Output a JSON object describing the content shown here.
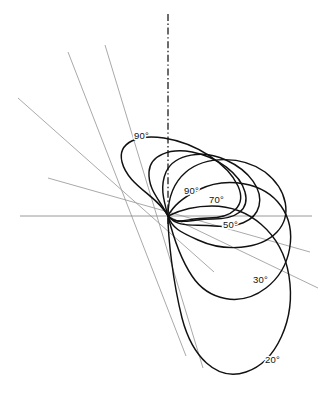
{
  "figure": {
    "kind": "polar-loop-diagram",
    "background_color": "#ffffff",
    "curve_color": "#111111",
    "radial_color": "#9a9a9a",
    "axis_color": "#8f8f8f",
    "centerline_color": "#141414",
    "origin": {
      "x": 168,
      "y": 216
    }
  },
  "labels": {
    "outer_90": "90°",
    "inner_90": "90°",
    "deg_70": "70°",
    "deg_50": "50°",
    "deg_30": "30°",
    "deg_20": "20°"
  },
  "label_positions": {
    "outer_90": {
      "x": 134,
      "y": 139
    },
    "inner_90": {
      "x": 184,
      "y": 194
    },
    "deg_70": {
      "x": 209,
      "y": 203
    },
    "deg_50": {
      "x": 223,
      "y": 228
    },
    "deg_30": {
      "x": 253,
      "y": 283
    },
    "deg_20": {
      "x": 265,
      "y": 363
    }
  },
  "chart_data": {
    "type": "line",
    "title": "",
    "xlabel": "",
    "ylabel": "",
    "coordinate_system": "polar",
    "grid": false,
    "legend": null,
    "origin_px": {
      "x": 168,
      "y": 216
    },
    "annotations": [
      "90°",
      "90°",
      "70°",
      "50°",
      "30°",
      "20°"
    ],
    "axes": [
      {
        "name": "horizontal-axis",
        "x1": 20,
        "y1": 216,
        "x2": 312,
        "y2": 216,
        "style": "solid-thin-gray"
      },
      {
        "name": "vertical-centerline",
        "x1": 168,
        "y1": 14,
        "x2": 168,
        "y2": 224,
        "style": "dash-dot-black"
      }
    ],
    "radial_lines": [
      {
        "name": "radial-1",
        "x1": 18,
        "y1": 98,
        "x2": 214,
        "y2": 272
      },
      {
        "name": "radial-2",
        "x1": 68,
        "y1": 52,
        "x2": 186,
        "y2": 356
      },
      {
        "name": "radial-3",
        "x1": 105,
        "y1": 45,
        "x2": 203,
        "y2": 368
      },
      {
        "name": "radial-4",
        "x1": 48,
        "y1": 178,
        "x2": 310,
        "y2": 252
      },
      {
        "name": "radial-5",
        "x1": 168,
        "y1": 216,
        "x2": 318,
        "y2": 288
      }
    ],
    "series": [
      {
        "name": "loop-90-outer",
        "label": "90°",
        "path": "M 168 216 C 158 196, 128 186, 122 162 C 117 142, 139 134, 164 138 C 196 143, 228 164, 238 186 C 247 206, 232 218, 208 218 C 186 218, 178 226, 168 216 Z"
      },
      {
        "name": "loop-90-inner",
        "label": "90°",
        "path": "M 168 216 C 160 200, 148 190, 149 172 C 150 155, 170 148, 192 152 C 218 157, 240 174, 245 192 C 250 210, 236 219, 213 219 C 190 219, 179 226, 168 216 Z"
      },
      {
        "name": "loop-70",
        "label": "70°",
        "path": "M 168 216 C 163 198, 160 186, 166 172 C 175 153, 204 150, 226 160 C 250 171, 263 190, 259 206 C 255 222, 236 228, 214 226 C 192 224, 178 228, 168 216 Z"
      },
      {
        "name": "loop-50",
        "label": "50°",
        "path": "M 168 216 C 168 200, 172 184, 186 172 C 206 155, 243 156, 265 172 C 288 190, 292 216, 277 232 C 260 250, 224 252, 198 240 C 180 232, 172 228, 168 216 Z"
      },
      {
        "name": "loop-30",
        "label": "30°",
        "path": "M 168 216 C 172 208, 182 198, 198 190 C 226 176, 264 182, 281 206 C 298 230, 292 268, 266 288 C 240 308, 208 300, 192 276 C 180 258, 172 232, 168 216 Z"
      },
      {
        "name": "loop-20",
        "label": "20°",
        "path": "M 168 216 C 176 212, 192 206, 212 206 C 248 206, 282 232, 289 276 C 296 320, 276 362, 246 372 C 216 382, 192 356, 182 318 C 173 282, 168 238, 168 216 Z"
      }
    ]
  }
}
